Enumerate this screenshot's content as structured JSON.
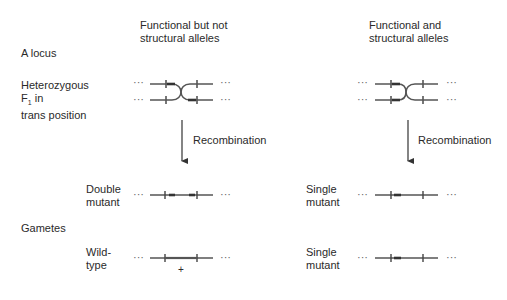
{
  "columns": {
    "left": {
      "title": "Functional but not\nstructural alleles"
    },
    "right": {
      "title": "Functional and\nstructural alleles"
    }
  },
  "row_labels": {
    "locus": "A locus",
    "heterozygous": "Heterozygous",
    "f1": "F",
    "f1_sub": "1",
    "f1_suffix": " in",
    "trans": "trans position",
    "gametes": "Gametes"
  },
  "arrows": {
    "left_label": "Recombination",
    "right_label": "Recombination"
  },
  "gametes": {
    "left": [
      {
        "label": "Double\nmutant",
        "marker": ""
      },
      {
        "label": "Wild-\ntype",
        "marker": "+"
      }
    ],
    "right": [
      {
        "label": "Single\nmutant"
      },
      {
        "label": "Single\nmutant"
      }
    ]
  },
  "ellipsis": "···",
  "colors": {
    "line": "#555555",
    "mutation": "#333333",
    "text": "#2a2a2a"
  }
}
